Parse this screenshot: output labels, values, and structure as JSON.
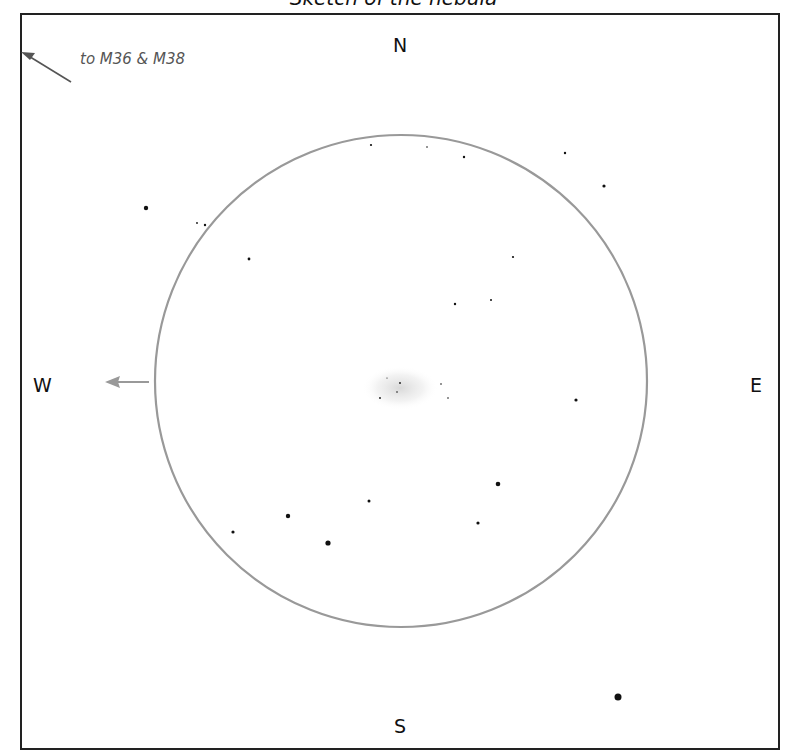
{
  "title": "Sketch of the nebula",
  "directions": {
    "north": "N",
    "south": "S",
    "east": "E",
    "west": "W"
  },
  "pointer_note": "to M36 & M38",
  "field": {
    "cx": 401,
    "cy": 381,
    "r": 246,
    "color": "#999999"
  },
  "stars": [
    {
      "x": 146,
      "y": 208,
      "r": 2.2
    },
    {
      "x": 197,
      "y": 223,
      "r": 0.9
    },
    {
      "x": 205,
      "y": 225,
      "r": 1.2
    },
    {
      "x": 249,
      "y": 259,
      "r": 1.4
    },
    {
      "x": 371,
      "y": 145,
      "r": 1.1
    },
    {
      "x": 427,
      "y": 147,
      "r": 0.8
    },
    {
      "x": 464,
      "y": 157,
      "r": 1.2
    },
    {
      "x": 565,
      "y": 153,
      "r": 1.2
    },
    {
      "x": 604,
      "y": 186,
      "r": 1.6
    },
    {
      "x": 513,
      "y": 257,
      "r": 1.1
    },
    {
      "x": 455,
      "y": 304,
      "r": 1.2
    },
    {
      "x": 491,
      "y": 300,
      "r": 1.0
    },
    {
      "x": 576,
      "y": 400,
      "r": 1.6
    },
    {
      "x": 233,
      "y": 532,
      "r": 1.6
    },
    {
      "x": 288,
      "y": 516,
      "r": 2.2
    },
    {
      "x": 328,
      "y": 543,
      "r": 2.6
    },
    {
      "x": 369,
      "y": 501,
      "r": 1.5
    },
    {
      "x": 498,
      "y": 484,
      "r": 2.3
    },
    {
      "x": 478,
      "y": 523,
      "r": 1.6
    },
    {
      "x": 618,
      "y": 697,
      "r": 3.5
    },
    {
      "x": 400,
      "y": 383,
      "r": 0.9
    },
    {
      "x": 397,
      "y": 392,
      "r": 0.8
    },
    {
      "x": 380,
      "y": 398,
      "r": 0.9
    },
    {
      "x": 441,
      "y": 384,
      "r": 0.8
    },
    {
      "x": 448,
      "y": 398,
      "r": 0.8
    },
    {
      "x": 387,
      "y": 378,
      "r": 0.6
    }
  ]
}
